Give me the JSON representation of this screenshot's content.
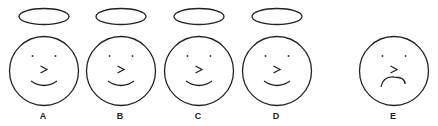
{
  "faces": [
    {
      "label": "A",
      "cx": 44,
      "halo": true,
      "mouth": "smile"
    },
    {
      "label": "B",
      "cx": 121,
      "halo": true,
      "mouth": "smile"
    },
    {
      "label": "C",
      "cx": 199,
      "halo": true,
      "mouth": "smile"
    },
    {
      "label": "D",
      "cx": 277,
      "halo": true,
      "mouth": "smile"
    },
    {
      "label": "E",
      "cx": 394,
      "halo": false,
      "mouth": "frown"
    }
  ],
  "nose_glyph": ">",
  "colors": {
    "line": "#222222",
    "background": "#ffffff"
  }
}
